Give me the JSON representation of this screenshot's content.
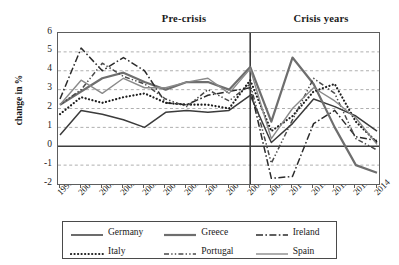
{
  "figure": {
    "y_axis_title": "change in %",
    "period_labels": [
      {
        "text": "Pre-crisis"
      },
      {
        "text": "Crisis years"
      }
    ]
  },
  "chart_data": {
    "type": "line",
    "title": "",
    "xlabel": "",
    "ylabel": "change in %",
    "xlim": [
      1999,
      2014
    ],
    "ylim": [
      -2,
      6
    ],
    "ytick_labels": [
      "6",
      "5",
      "4",
      "3",
      "2",
      "1",
      "0",
      "-1",
      "-2"
    ],
    "ytick_values": [
      6,
      5,
      4,
      3,
      2,
      1,
      0,
      -1,
      -2
    ],
    "grid": "horizontal-dashed",
    "zero_line": true,
    "divider_x": 2008,
    "annotations": [
      {
        "text": "Pre-crisis",
        "x_range": [
          1999,
          2008
        ],
        "position": "above-plot"
      },
      {
        "text": "Crisis years",
        "x_range": [
          2008,
          2014
        ],
        "position": "above-plot"
      }
    ],
    "legend_position": "below",
    "categories": [
      "1999",
      "2000",
      "2001",
      "2002",
      "2003",
      "2004",
      "2005",
      "2006",
      "2007",
      "2008",
      "2009",
      "2010",
      "2011",
      "2012",
      "2013",
      "2014"
    ],
    "x": [
      1999,
      2000,
      2001,
      2002,
      2003,
      2004,
      2005,
      2006,
      2007,
      2008,
      2009,
      2010,
      2011,
      2012,
      2013,
      2014
    ],
    "series": [
      {
        "name": "Germany",
        "color": "#3b3b3b",
        "style": "solid",
        "width": 1.5,
        "values": [
          0.6,
          1.9,
          1.7,
          1.4,
          1.0,
          1.8,
          1.9,
          1.8,
          1.9,
          2.7,
          0.2,
          1.2,
          2.5,
          2.1,
          1.6,
          0.8
        ]
      },
      {
        "name": "Greece",
        "color": "#6e6e6e",
        "style": "solid",
        "width": 2.2,
        "values": [
          2.2,
          2.9,
          3.6,
          3.9,
          3.4,
          3.0,
          3.4,
          3.4,
          3.0,
          4.2,
          1.3,
          4.7,
          3.3,
          1.0,
          -1.0,
          -1.4
        ]
      },
      {
        "name": "Ireland",
        "color": "#2b2b2b",
        "style": "dashdot-long",
        "width": 1.5,
        "values": [
          2.5,
          5.2,
          4.0,
          4.7,
          4.0,
          2.3,
          2.2,
          2.7,
          2.9,
          3.1,
          -1.7,
          -1.6,
          1.2,
          1.9,
          0.5,
          0.3
        ]
      },
      {
        "name": "Italy",
        "color": "#1f1f1f",
        "style": "dotted",
        "width": 2.2,
        "values": [
          1.7,
          2.6,
          2.3,
          2.6,
          2.8,
          2.3,
          2.2,
          2.2,
          2.0,
          3.5,
          0.8,
          1.6,
          2.9,
          3.3,
          1.3,
          0.2
        ]
      },
      {
        "name": "Portugal",
        "color": "#4a4a4a",
        "style": "dashdotdash",
        "width": 1.5,
        "values": [
          2.2,
          3.0,
          4.4,
          3.7,
          3.3,
          2.5,
          2.1,
          3.0,
          2.4,
          3.3,
          -0.9,
          1.4,
          3.6,
          2.8,
          0.4,
          -0.2
        ]
      },
      {
        "name": "Spain",
        "color": "#8a8a8a",
        "style": "solid-thin",
        "width": 1.4,
        "values": [
          2.2,
          3.5,
          2.8,
          3.6,
          3.1,
          3.1,
          3.4,
          3.6,
          2.8,
          4.1,
          0.4,
          2.0,
          3.1,
          2.4,
          1.5,
          0.1
        ]
      }
    ]
  },
  "legend": {
    "rows": [
      [
        {
          "label": "Germany",
          "series": 0
        },
        {
          "label": "Greece",
          "series": 1
        },
        {
          "label": "Ireland",
          "series": 2
        }
      ],
      [
        {
          "label": "Italy",
          "series": 3
        },
        {
          "label": "Portugal",
          "series": 4
        },
        {
          "label": "Spain",
          "series": 5
        }
      ]
    ]
  }
}
